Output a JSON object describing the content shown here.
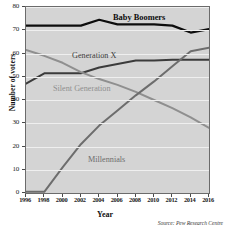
{
  "chart_data": {
    "type": "line",
    "title": "",
    "xlabel": "Year",
    "ylabel": "Number of voters",
    "xlim": [
      1996,
      2016
    ],
    "ylim": [
      0,
      80
    ],
    "grid": true,
    "legend_position": "inline-labels",
    "source": "Source: Pew Research Centre",
    "x": [
      1996,
      1998,
      2000,
      2002,
      2004,
      2006,
      2008,
      2010,
      2012,
      2014,
      2016
    ],
    "xtick_labels": [
      "1996",
      "1998",
      "2000",
      "2002",
      "2004",
      "2006",
      "2008",
      "2010",
      "2012",
      "2014",
      "2016"
    ],
    "ytick_labels": [
      "0",
      "10",
      "20",
      "30",
      "40",
      "50",
      "60",
      "70",
      "80"
    ],
    "yticks": [
      0,
      10,
      20,
      30,
      40,
      50,
      60,
      70,
      80
    ],
    "series": [
      {
        "name": "Baby Boomers",
        "color": "#0d0d0d",
        "width": 2.2,
        "values": [
          72,
          72,
          72,
          72,
          74.5,
          72.5,
          72.5,
          72.5,
          72,
          69,
          70.5
        ]
      },
      {
        "name": "Generation X",
        "color": "#3b3b3b",
        "width": 2.0,
        "values": [
          47,
          51.5,
          51.5,
          51.5,
          54,
          55.5,
          57,
          57,
          57.3,
          57.3,
          57.3
        ]
      },
      {
        "name": "Silent Generation",
        "color": "#8f8f8f",
        "width": 2.0,
        "values": [
          61.5,
          59,
          56,
          52,
          49,
          46.5,
          43.5,
          40,
          36.5,
          32.5,
          28
        ]
      },
      {
        "name": "Millennials",
        "color": "#6d6d6d",
        "width": 2.0,
        "values": [
          0.5,
          0.5,
          11,
          21,
          29,
          35.5,
          42,
          48,
          54.5,
          61,
          62.5
        ]
      }
    ]
  },
  "axes": {
    "y_title": "Number of voters",
    "x_title": "Year"
  },
  "labels": {
    "baby_boomers": "Baby Boomers",
    "generation_x": "Generation X",
    "silent_generation": "Silent Generation",
    "millennials": "Millennials"
  },
  "footer": {
    "source": "Source: Pew Research Centre"
  }
}
